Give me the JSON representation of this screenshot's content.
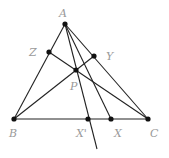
{
  "diagram": {
    "colors": {
      "line": "#222222",
      "point": "#111111",
      "label": "#9a9a9a",
      "background": "#ffffff"
    },
    "points": [
      {
        "id": "A",
        "label": "A",
        "x": 65,
        "y": 24,
        "lx": 59,
        "ly": 17
      },
      {
        "id": "B",
        "label": "B",
        "x": 14,
        "y": 119,
        "lx": 9,
        "ly": 137
      },
      {
        "id": "C",
        "label": "C",
        "x": 148,
        "y": 119,
        "lx": 150,
        "ly": 137
      },
      {
        "id": "Z",
        "label": "Z",
        "x": 49,
        "y": 52,
        "lx": 29,
        "ly": 56
      },
      {
        "id": "Y",
        "label": "Y",
        "x": 94,
        "y": 56,
        "lx": 106,
        "ly": 60
      },
      {
        "id": "P",
        "label": "P",
        "x": 76,
        "y": 70,
        "lx": 70,
        "ly": 90
      },
      {
        "id": "X'",
        "label": "X'",
        "x": 88,
        "y": 119,
        "lx": 76,
        "ly": 137
      },
      {
        "id": "X",
        "label": "X",
        "x": 111,
        "y": 119,
        "lx": 114,
        "ly": 137
      }
    ],
    "segments": [
      {
        "from": "A",
        "to": "B"
      },
      {
        "from": "A",
        "to": "C"
      },
      {
        "from": "B",
        "to": "C"
      },
      {
        "from": "A",
        "to": "X"
      },
      {
        "from": "B",
        "to": "Y"
      },
      {
        "from": "C",
        "to": "Z"
      }
    ],
    "rays": [
      {
        "from": "A",
        "through": "X'",
        "end": {
          "x": 97,
          "y": 149
        }
      }
    ]
  }
}
